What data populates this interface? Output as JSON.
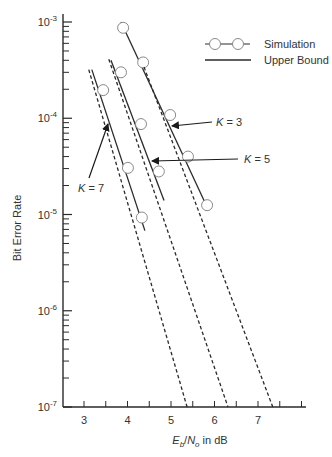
{
  "chart_data": {
    "type": "line",
    "title": "",
    "xlabel": "E_b/N_o in dB",
    "xlabel_parts": {
      "e": "E",
      "b": "b",
      "slash": "/",
      "n": "N",
      "o": "o",
      "suffix": " in dB"
    },
    "ylabel": "Bit Error Rate",
    "xscale": "linear",
    "yscale": "log",
    "xlim": [
      2.5,
      8.1
    ],
    "ylim": [
      1e-07,
      0.001
    ],
    "x_ticks": [
      3,
      4,
      5,
      6,
      7
    ],
    "x_minor_ticks": [
      3,
      3.5,
      4,
      4.5,
      5,
      5.5,
      6,
      6.5,
      7,
      7.5,
      8
    ],
    "y_ticks": [
      {
        "value": 0.001,
        "base": "10",
        "exp": "-3"
      },
      {
        "value": 0.0001,
        "base": "10",
        "exp": "-4"
      },
      {
        "value": 1e-05,
        "base": "10",
        "exp": "-5"
      },
      {
        "value": 1e-06,
        "base": "10",
        "exp": "-6"
      },
      {
        "value": 1e-07,
        "base": "10",
        "exp": "-7"
      }
    ],
    "grid": false,
    "legend": {
      "position": "upper right",
      "entries": [
        {
          "label": "Simulation",
          "style": "solid line with open circles"
        },
        {
          "label": "Upper Bound",
          "style": "solid line"
        }
      ]
    },
    "series": [
      {
        "name": "Simulation K = 3",
        "style": "solid-markers",
        "x": [
          3.9,
          4.36,
          4.98,
          5.39,
          5.83
        ],
        "y": [
          0.00087,
          0.00038,
          0.000108,
          4e-05,
          1.25e-05
        ],
        "line_extent": {
          "x": [
            3.85,
            5.81
          ],
          "y": [
            0.001,
            1.25e-05
          ]
        }
      },
      {
        "name": "Simulation K = 5",
        "style": "solid-markers",
        "x": [
          3.85,
          4.31,
          4.72
        ],
        "y": [
          0.0003,
          8.7e-05,
          2.8e-05
        ],
        "line_extent": {
          "x": [
            3.62,
            4.84
          ],
          "y": [
            0.0004,
            1.4e-05
          ]
        }
      },
      {
        "name": "Simulation K = 7",
        "style": "solid-markers",
        "x": [
          3.44,
          4.01,
          4.33
        ],
        "y": [
          0.000196,
          3.05e-05,
          9.3e-06
        ],
        "line_extent": {
          "x": [
            3.18,
            4.4
          ],
          "y": [
            0.00032,
            6.8e-06
          ]
        }
      },
      {
        "name": "Upper Bound K = 3",
        "style": "dashed",
        "x": [
          4.38,
          7.34
        ],
        "y": [
          0.00034,
          1e-07
        ]
      },
      {
        "name": "Upper Bound K = 5",
        "style": "dashed",
        "x": [
          3.57,
          6.31
        ],
        "y": [
          0.00041,
          1e-07
        ]
      },
      {
        "name": "Upper Bound K = 7",
        "style": "dashed",
        "x": [
          3.11,
          5.37
        ],
        "y": [
          0.00032,
          1e-07
        ]
      }
    ],
    "annotations": [
      {
        "text_k": "K",
        "text_rest": " = 3",
        "label_pos": [
          216,
          126
        ],
        "arrow_from": [
          212,
          122
        ],
        "arrow_to": [
          172,
          126
        ]
      },
      {
        "text_k": "K",
        "text_rest": " = 5",
        "label_pos": [
          244,
          163
        ],
        "arrow_from": [
          238,
          159
        ],
        "arrow_to": [
          152,
          161
        ]
      },
      {
        "text_k": "K",
        "text_rest": " = 7",
        "label_pos": [
          78,
          192
        ],
        "arrow_from": [
          89,
          178
        ],
        "arrow_to": [
          108,
          124
        ]
      }
    ],
    "colors": {
      "line": "#2a2a2a",
      "marker_edge": "#8a8a8a",
      "marker_fill": "#ffffff",
      "text": "#333333"
    }
  }
}
